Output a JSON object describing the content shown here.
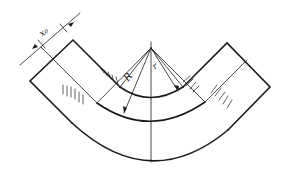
{
  "diagram": {
    "type": "pipe-bend-cross-section",
    "labels": {
      "thickness": "x₀",
      "outer_radius": "R",
      "inner_radius": "r"
    },
    "colors": {
      "line": "#1a1a1a",
      "background": "#ffffff"
    }
  }
}
